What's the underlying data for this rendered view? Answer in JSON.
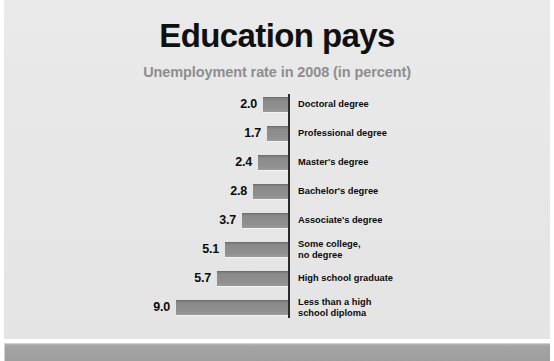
{
  "chart_data": {
    "type": "bar",
    "orientation": "horizontal-left",
    "title": "Education pays",
    "subtitle": "Unemployment rate in 2008 (in percent)",
    "xlabel": "",
    "ylabel": "",
    "xlim": [
      0,
      9.0
    ],
    "grid": false,
    "legend": null,
    "value_unit": "percent",
    "categories": [
      "Doctoral degree",
      "Professional degree",
      "Master's degree",
      "Bachelor's degree",
      "Associate's degree",
      "Some college,\nno degree",
      "High school graduate",
      "Less than a high\nschool diploma"
    ],
    "values": [
      2.0,
      1.7,
      2.4,
      2.8,
      3.7,
      5.1,
      5.7,
      9.0
    ],
    "value_labels": [
      "2.0",
      "1.7",
      "2.4",
      "2.8",
      "3.7",
      "5.1",
      "5.7",
      "9.0"
    ],
    "bars": [
      {
        "label": "Doctoral degree",
        "value": 2.0,
        "value_label": "2.0"
      },
      {
        "label": "Professional degree",
        "value": 1.7,
        "value_label": "1.7"
      },
      {
        "label": "Master's degree",
        "value": 2.4,
        "value_label": "2.4"
      },
      {
        "label": "Bachelor's degree",
        "value": 2.8,
        "value_label": "2.8"
      },
      {
        "label": "Associate's degree",
        "value": 3.7,
        "value_label": "3.7"
      },
      {
        "label": "Some college,\nno degree",
        "value": 5.1,
        "value_label": "5.1"
      },
      {
        "label": "High school graduate",
        "value": 5.7,
        "value_label": "5.7"
      },
      {
        "label": "Less than a high\nschool diploma",
        "value": 9.0,
        "value_label": "9.0"
      }
    ],
    "colors": {
      "background": "#e7e7e7",
      "bar_fill": "#8b8b8b",
      "bar_edge_top": "#6f6f6f",
      "axis_line": "#2b2b2b",
      "title_text": "#101010",
      "subtitle_text": "#8e8e8e",
      "label_text": "#0b0b0b",
      "footer_band": "#a3a3a3"
    }
  }
}
